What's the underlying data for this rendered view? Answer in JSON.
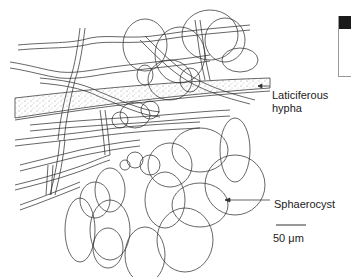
{
  "figure": {
    "labels": {
      "laticiferous_line1": "Laticiferous",
      "laticiferous_line2": "hypha",
      "sphaerocyst": "Sphaerocyst",
      "scale_bar": "50 μm"
    },
    "colors": {
      "line": "#333333",
      "background": "#ffffff",
      "stipple": "#888888"
    }
  }
}
